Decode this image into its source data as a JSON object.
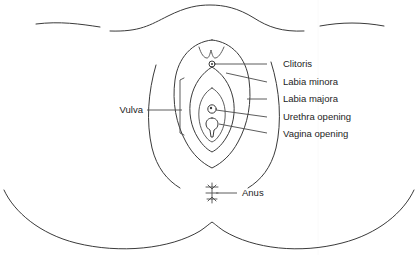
{
  "figure": {
    "type": "anatomical-line-diagram",
    "background_color": "#ffffff",
    "stroke_color": "#3a3a3a",
    "text_color": "#1d1d1d"
  },
  "labels": {
    "clitoris": "Clitoris",
    "labia_minora": "Labia minora",
    "labia_majora": "Labia majora",
    "urethra_opening": "Urethra opening",
    "vagina_opening": "Vagina opening",
    "vulva": "Vulva",
    "anus": "Anus"
  },
  "label_positions": {
    "clitoris": {
      "x": 283,
      "y": 67,
      "leader_from_x": 267,
      "leader_to_x": 212,
      "leader_to_y": 64
    },
    "labia_minora": {
      "x": 283,
      "y": 85,
      "leader_from_x": 267,
      "leader_to_x": 226,
      "leader_to_y": 73
    },
    "labia_majora": {
      "x": 283,
      "y": 102,
      "leader_from_x": 267,
      "leader_to_x": 247,
      "leader_to_y": 99
    },
    "urethra_opening": {
      "x": 283,
      "y": 120,
      "leader_from_x": 267,
      "leader_to_x": 215,
      "leader_to_y": 109
    },
    "vagina_opening": {
      "x": 283,
      "y": 137,
      "leader_from_x": 267,
      "leader_to_x": 216,
      "leader_to_y": 124
    },
    "vulva": {
      "x": 140,
      "y": 110,
      "leader_from_x": 147,
      "leader_to_x": 180
    },
    "anus": {
      "x": 242,
      "y": 195,
      "leader_from_x": 237,
      "leader_to_x": 216
    }
  },
  "structures": [
    {
      "name": "mons-pubis-outline",
      "note": "broad upper mound curve"
    },
    {
      "name": "left-thigh-crease",
      "note": "long curve left of vulva"
    },
    {
      "name": "right-thigh-crease",
      "note": "long curve right of vulva"
    },
    {
      "name": "labia-majora-outline",
      "note": "large vertical oval"
    },
    {
      "name": "labia-minora-outline",
      "note": "inner pointed oval"
    },
    {
      "name": "vestibule-outline",
      "note": "innermost narrow oval"
    },
    {
      "name": "clitoral-hood",
      "note": "small crown curve above clitoris"
    },
    {
      "name": "clitoris-marker",
      "note": "small circle"
    },
    {
      "name": "urethra-marker",
      "note": "tiny circle"
    },
    {
      "name": "vagina-marker",
      "note": "elongated teardrop"
    },
    {
      "name": "vulva-bracket",
      "note": "square bracket spanning vulva region"
    },
    {
      "name": "anus-marker",
      "note": "small starburst"
    },
    {
      "name": "buttock-outline",
      "note": "wide lower U curve with central bump"
    }
  ]
}
